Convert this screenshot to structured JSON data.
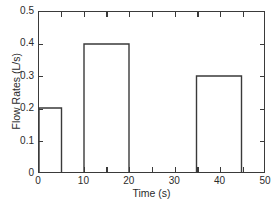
{
  "chart_data": {
    "type": "bar",
    "title": "",
    "xlabel": "Time (s)",
    "ylabel": "Flow Rates (L/s)",
    "xlim": [
      0,
      50
    ],
    "ylim": [
      0,
      0.5
    ],
    "grid": false,
    "legend": null,
    "line_color": "#3a3a3a",
    "background_color": "#ffffff",
    "x_ticks": [
      0,
      10,
      20,
      30,
      40,
      50
    ],
    "x_tick_labels": [
      "0",
      "10",
      "20",
      "30",
      "40",
      "50"
    ],
    "x_minor_ticks": [
      5,
      15,
      25,
      35,
      45
    ],
    "y_ticks": [
      0,
      0.1,
      0.2,
      0.3,
      0.4,
      0.5
    ],
    "y_tick_labels": [
      "0",
      "0.1",
      "0.2",
      "0.3",
      "0.4",
      "0.5"
    ],
    "bars": [
      {
        "label": "0-5 s",
        "x_start": 0,
        "x_end": 5,
        "value": 0.2
      },
      {
        "label": "10-20 s",
        "x_start": 10,
        "x_end": 20,
        "value": 0.4
      },
      {
        "label": "35-45 s",
        "x_start": 35,
        "x_end": 45,
        "value": 0.3
      }
    ],
    "categories": [
      "0-5 s",
      "10-20 s",
      "35-45 s"
    ],
    "values": [
      0.2,
      0.4,
      0.3
    ]
  }
}
